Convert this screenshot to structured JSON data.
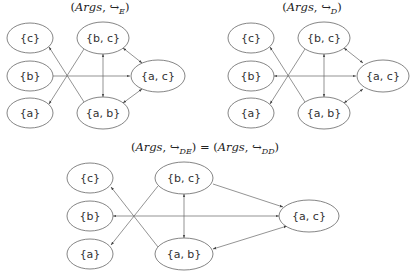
{
  "graphs": [
    {
      "id": "E",
      "title": "(Args, ↪E)",
      "title_parts": {
        "open": "(",
        "args": "Args",
        "sep": ", ",
        "arrow": "↪",
        "sub": "E",
        "close": ")"
      },
      "nodes": [
        {
          "id": "c",
          "label": "{c}"
        },
        {
          "id": "b",
          "label": "{b}"
        },
        {
          "id": "a",
          "label": "{a}"
        },
        {
          "id": "bc",
          "label": "{b, c}"
        },
        {
          "id": "ab",
          "label": "{a, b}"
        },
        {
          "id": "ac",
          "label": "{a, c}"
        }
      ],
      "edges": [
        {
          "from": "b",
          "to": "ac",
          "bidirectional": false
        },
        {
          "from": "ab",
          "to": "c",
          "bidirectional": false
        },
        {
          "from": "bc",
          "to": "a",
          "bidirectional": false
        },
        {
          "from": "bc",
          "to": "ab",
          "bidirectional": true
        },
        {
          "from": "bc",
          "to": "ac",
          "bidirectional": true
        },
        {
          "from": "ab",
          "to": "ac",
          "bidirectional": true
        }
      ]
    },
    {
      "id": "D",
      "title": "(Args, ↪D)",
      "title_parts": {
        "open": "(",
        "args": "Args",
        "sep": ", ",
        "arrow": "↪",
        "sub": "D",
        "close": ")"
      },
      "nodes": [
        {
          "id": "c",
          "label": "{c}"
        },
        {
          "id": "b",
          "label": "{b}"
        },
        {
          "id": "a",
          "label": "{a}"
        },
        {
          "id": "bc",
          "label": "{b, c}"
        },
        {
          "id": "ab",
          "label": "{a, b}"
        },
        {
          "id": "ac",
          "label": "{a, c}"
        }
      ],
      "edges": [
        {
          "from": "b",
          "to": "ac",
          "bidirectional": true
        },
        {
          "from": "ab",
          "to": "c",
          "bidirectional": false
        },
        {
          "from": "bc",
          "to": "a",
          "bidirectional": false
        },
        {
          "from": "bc",
          "to": "ab",
          "bidirectional": true
        },
        {
          "from": "bc",
          "to": "ac",
          "bidirectional": true
        },
        {
          "from": "ab",
          "to": "ac",
          "bidirectional": true
        }
      ]
    },
    {
      "id": "DE_DD",
      "title": "(Args, ↪DE) = (Args, ↪DD)",
      "title_parts": {
        "open": "(",
        "args": "Args",
        "sep": ", ",
        "arrow": "↪",
        "sub": "DE",
        "close": ")",
        "eq": " = ",
        "sub2": "DD"
      },
      "nodes": [
        {
          "id": "c",
          "label": "{c}"
        },
        {
          "id": "b",
          "label": "{b}"
        },
        {
          "id": "a",
          "label": "{a}"
        },
        {
          "id": "bc",
          "label": "{b, c}"
        },
        {
          "id": "ab",
          "label": "{a, b}"
        },
        {
          "id": "ac",
          "label": "{a, c}"
        }
      ],
      "edges": [
        {
          "from": "b",
          "to": "ac",
          "bidirectional": true
        },
        {
          "from": "ab",
          "to": "c",
          "bidirectional": false
        },
        {
          "from": "bc",
          "to": "a",
          "bidirectional": false
        },
        {
          "from": "bc",
          "to": "ab",
          "bidirectional": true
        },
        {
          "from": "bc",
          "to": "ac",
          "bidirectional": false
        },
        {
          "from": "ab",
          "to": "ac",
          "bidirectional": true
        }
      ]
    }
  ]
}
